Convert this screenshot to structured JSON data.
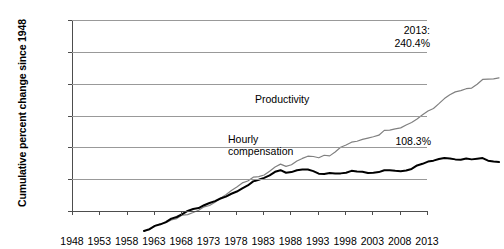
{
  "chart_data": {
    "type": "line",
    "title": "",
    "xlabel": "",
    "ylabel": "Cumulative percent change since 1948",
    "xlim": [
      1948,
      2013
    ],
    "ylim": [
      0,
      300
    ],
    "grid": true,
    "legend": "inline-labels",
    "y_ticks": [
      "0%",
      "50%",
      "100%",
      "150%",
      "200%",
      "250%",
      "300%"
    ],
    "y_tick_values": [
      0,
      50,
      100,
      150,
      200,
      250,
      300
    ],
    "x_ticks": [
      "1948",
      "1953",
      "1958",
      "1963",
      "1968",
      "1973",
      "1978",
      "1983",
      "1988",
      "1993",
      "1998",
      "2003",
      "2008",
      "2013"
    ],
    "x_tick_values": [
      1948,
      1953,
      1958,
      1963,
      1968,
      1973,
      1978,
      1983,
      1988,
      1993,
      1998,
      2003,
      2008,
      2013
    ],
    "annotations": [
      {
        "name": "productivity-end",
        "line1": "2013:",
        "line2": "240.4%",
        "value": 240.4,
        "year": 2013
      },
      {
        "name": "hourly-compensation-end",
        "line1": "108.3%",
        "line2": "",
        "value": 108.3,
        "year": 2013
      }
    ],
    "series": [
      {
        "name": "Productivity",
        "color": "#808080",
        "label_line1": "Productivity",
        "label_line2": "",
        "x": [
          1948,
          1949,
          1950,
          1951,
          1952,
          1953,
          1954,
          1955,
          1956,
          1957,
          1958,
          1959,
          1960,
          1961,
          1962,
          1963,
          1964,
          1965,
          1966,
          1967,
          1968,
          1969,
          1970,
          1971,
          1972,
          1973,
          1974,
          1975,
          1976,
          1977,
          1978,
          1979,
          1980,
          1981,
          1982,
          1983,
          1984,
          1985,
          1986,
          1987,
          1988,
          1989,
          1990,
          1991,
          1992,
          1993,
          1994,
          1995,
          1996,
          1997,
          1998,
          1999,
          2000,
          2001,
          2002,
          2003,
          2004,
          2005,
          2006,
          2007,
          2008,
          2009,
          2010,
          2011,
          2012,
          2013
        ],
        "values": [
          0.0,
          1.8,
          8.5,
          11.0,
          13.0,
          17.5,
          19.5,
          25.0,
          25.8,
          29.0,
          32.5,
          38.0,
          40.0,
          45.0,
          51.5,
          57.0,
          63.5,
          69.0,
          75.5,
          78.5,
          84.5,
          85.5,
          88.0,
          94.0,
          100.5,
          105.0,
          101.5,
          104.0,
          110.0,
          114.0,
          117.5,
          117.0,
          115.0,
          119.0,
          118.0,
          124.0,
          131.5,
          135.0,
          139.5,
          141.0,
          144.0,
          146.0,
          148.0,
          150.5,
          158.0,
          158.5,
          160.5,
          162.0,
          166.5,
          170.5,
          176.0,
          182.5,
          188.5,
          192.5,
          200.0,
          208.0,
          214.0,
          218.5,
          220.5,
          223.5,
          224.5,
          230.5,
          238.0,
          238.5,
          239.0,
          240.4
        ]
      },
      {
        "name": "Hourly compensation",
        "color": "#000000",
        "label_line1": "Hourly",
        "label_line2": "compensation",
        "x": [
          1948,
          1949,
          1950,
          1951,
          1952,
          1953,
          1954,
          1955,
          1956,
          1957,
          1958,
          1959,
          1960,
          1961,
          1962,
          1963,
          1964,
          1965,
          1966,
          1967,
          1968,
          1969,
          1970,
          1971,
          1972,
          1973,
          1974,
          1975,
          1976,
          1977,
          1978,
          1979,
          1980,
          1981,
          1982,
          1983,
          1984,
          1985,
          1986,
          1987,
          1988,
          1989,
          1990,
          1991,
          1992,
          1993,
          1994,
          1995,
          1996,
          1997,
          1998,
          1999,
          2000,
          2001,
          2002,
          2003,
          2004,
          2005,
          2006,
          2007,
          2008,
          2009,
          2010,
          2011,
          2012,
          2013
        ],
        "values": [
          0.0,
          3.0,
          8.0,
          10.5,
          14.0,
          19.5,
          22.0,
          26.5,
          31.5,
          34.5,
          36.0,
          40.5,
          44.0,
          47.0,
          51.0,
          54.0,
          58.5,
          62.0,
          67.0,
          71.5,
          78.0,
          80.5,
          83.5,
          87.5,
          93.0,
          95.5,
          91.5,
          92.5,
          95.5,
          96.5,
          96.5,
          94.0,
          90.0,
          89.5,
          91.0,
          90.5,
          90.5,
          91.5,
          94.5,
          93.5,
          93.0,
          91.0,
          91.5,
          92.5,
          95.5,
          95.5,
          94.5,
          94.0,
          95.0,
          97.5,
          103.0,
          105.5,
          109.0,
          110.5,
          113.0,
          114.5,
          114.0,
          112.5,
          112.0,
          114.0,
          112.5,
          113.5,
          114.5,
          110.5,
          109.0,
          108.3
        ]
      }
    ]
  }
}
